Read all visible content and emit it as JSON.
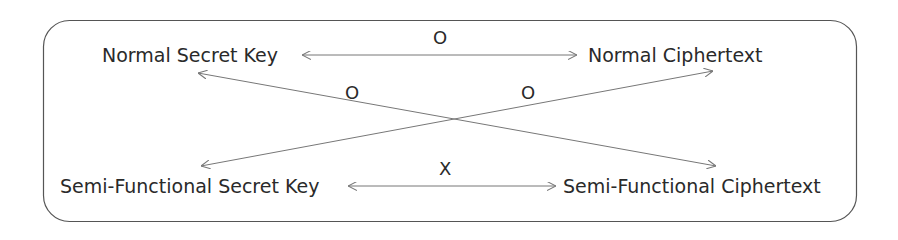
{
  "nodes": {
    "normal_secret_key": "Normal Secret Key",
    "normal_ciphertext": "Normal Ciphertext",
    "semi_functional_secret_key": "Semi-Functional Secret Key",
    "semi_functional_ciphertext": "Semi-Functional Ciphertext"
  },
  "edges": {
    "top": {
      "from": "Normal Secret Key",
      "to": "Normal Ciphertext",
      "label": "O"
    },
    "diag_down": {
      "from": "Normal Secret Key",
      "to": "Semi-Functional Ciphertext",
      "label": "O"
    },
    "diag_up": {
      "from": "Semi-Functional Secret Key",
      "to": "Normal Ciphertext",
      "label": "O"
    },
    "bottom": {
      "from": "Semi-Functional Secret Key",
      "to": "Semi-Functional Ciphertext",
      "label": "X"
    }
  },
  "colors": {
    "line": "#777777",
    "border": "#555555",
    "text": "#2a2a2a"
  }
}
